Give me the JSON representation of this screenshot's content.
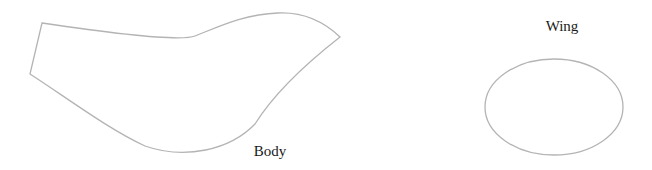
{
  "diagram": {
    "shapes": [
      {
        "id": "body",
        "label": "Body",
        "type": "freeform-polygon"
      },
      {
        "id": "wing",
        "label": "Wing",
        "type": "ellipse"
      }
    ],
    "colors": {
      "stroke": "#b4b4b4",
      "text": "#1a1a1a",
      "background": "#ffffff"
    }
  }
}
